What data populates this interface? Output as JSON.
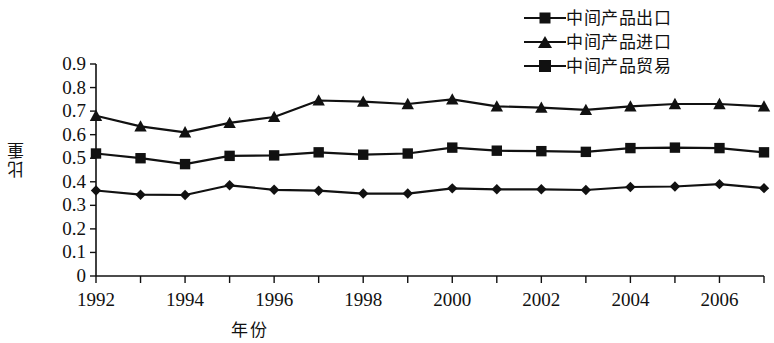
{
  "chart_data": {
    "type": "line",
    "title": "",
    "xlabel": "年份",
    "ylabel": "比重",
    "xlim": [
      1992,
      2007
    ],
    "ylim": [
      0,
      0.9
    ],
    "ytick_step": 0.1,
    "grid": false,
    "legend_position": "top-right",
    "x": [
      1992,
      1993,
      1994,
      1995,
      1996,
      1997,
      1998,
      1999,
      2000,
      2001,
      2002,
      2003,
      2004,
      2005,
      2006,
      2007
    ],
    "x_tick_labels": [
      "1992",
      "1994",
      "1996",
      "1998",
      "2000",
      "2002",
      "2004",
      "2006"
    ],
    "y_tick_labels": [
      "0.9",
      "0.8",
      "0.7",
      "0.6",
      "0.5",
      "0.4",
      "0.3",
      "0.2",
      "0.1",
      "0"
    ],
    "series": [
      {
        "name": "中间产品进口",
        "marker": "triangle",
        "color": "#111111",
        "values": [
          0.68,
          0.635,
          0.61,
          0.65,
          0.675,
          0.745,
          0.74,
          0.73,
          0.75,
          0.72,
          0.715,
          0.705,
          0.72,
          0.73,
          0.73,
          0.72
        ]
      },
      {
        "name": "中间产品贸易",
        "marker": "square",
        "color": "#111111",
        "values": [
          0.52,
          0.5,
          0.475,
          0.51,
          0.512,
          0.525,
          0.515,
          0.52,
          0.545,
          0.532,
          0.53,
          0.527,
          0.543,
          0.545,
          0.543,
          0.525
        ]
      },
      {
        "name": "中间产品出口",
        "marker": "diamond",
        "color": "#111111",
        "values": [
          0.363,
          0.345,
          0.344,
          0.385,
          0.366,
          0.362,
          0.35,
          0.35,
          0.372,
          0.368,
          0.368,
          0.365,
          0.378,
          0.38,
          0.39,
          0.373
        ]
      }
    ]
  },
  "legend": {
    "items": [
      {
        "label": "中间产品出口",
        "marker": "diamond"
      },
      {
        "label": "中间产品进口",
        "marker": "triangle"
      },
      {
        "label": "中间产品贸易",
        "marker": "square"
      }
    ]
  },
  "axes": {
    "y_title": "比重",
    "x_title": "年份"
  }
}
